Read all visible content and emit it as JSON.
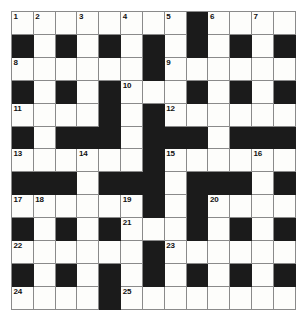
{
  "puzzle": {
    "kind": "crossword-grid",
    "columns": 13,
    "rows": 13,
    "colors": {
      "block": "#1b1b1b",
      "open": "#fdfdfb",
      "gridline": "#8a8a8a",
      "number": "#111111",
      "page_background": "#ffffff"
    },
    "legend": {
      "0": "open cell",
      "1": "blocked cell"
    },
    "grid": [
      [
        0,
        0,
        0,
        0,
        0,
        0,
        0,
        0,
        1,
        0,
        0,
        0,
        0
      ],
      [
        1,
        0,
        1,
        0,
        1,
        0,
        1,
        0,
        1,
        0,
        1,
        0,
        1
      ],
      [
        0,
        0,
        0,
        0,
        0,
        0,
        1,
        0,
        0,
        0,
        0,
        0,
        0
      ],
      [
        1,
        0,
        1,
        0,
        1,
        0,
        0,
        0,
        1,
        0,
        1,
        0,
        1
      ],
      [
        0,
        0,
        0,
        0,
        1,
        0,
        1,
        0,
        0,
        0,
        0,
        0,
        0
      ],
      [
        1,
        0,
        1,
        1,
        1,
        0,
        1,
        1,
        1,
        0,
        1,
        1,
        1
      ],
      [
        0,
        0,
        0,
        0,
        0,
        0,
        1,
        0,
        0,
        0,
        0,
        0,
        0
      ],
      [
        1,
        1,
        1,
        0,
        1,
        1,
        1,
        0,
        1,
        1,
        1,
        0,
        1
      ],
      [
        0,
        0,
        0,
        0,
        0,
        0,
        1,
        0,
        1,
        0,
        0,
        0,
        0
      ],
      [
        1,
        0,
        1,
        0,
        1,
        0,
        0,
        0,
        1,
        0,
        1,
        0,
        1
      ],
      [
        0,
        0,
        0,
        0,
        0,
        0,
        1,
        0,
        0,
        0,
        0,
        0,
        0
      ],
      [
        1,
        0,
        1,
        0,
        1,
        0,
        1,
        0,
        1,
        0,
        1,
        0,
        1
      ],
      [
        0,
        0,
        0,
        0,
        1,
        0,
        0,
        0,
        0,
        0,
        0,
        0,
        0
      ]
    ],
    "numbers": [
      {
        "row": 0,
        "col": 0,
        "label": "1"
      },
      {
        "row": 0,
        "col": 1,
        "label": "2"
      },
      {
        "row": 0,
        "col": 3,
        "label": "3"
      },
      {
        "row": 0,
        "col": 5,
        "label": "4"
      },
      {
        "row": 0,
        "col": 7,
        "label": "5"
      },
      {
        "row": 0,
        "col": 9,
        "label": "6"
      },
      {
        "row": 0,
        "col": 11,
        "label": "7"
      },
      {
        "row": 2,
        "col": 0,
        "label": "8"
      },
      {
        "row": 2,
        "col": 7,
        "label": "9"
      },
      {
        "row": 3,
        "col": 5,
        "label": "10"
      },
      {
        "row": 4,
        "col": 0,
        "label": "11"
      },
      {
        "row": 4,
        "col": 7,
        "label": "12"
      },
      {
        "row": 6,
        "col": 0,
        "label": "13"
      },
      {
        "row": 6,
        "col": 3,
        "label": "14"
      },
      {
        "row": 6,
        "col": 7,
        "label": "15"
      },
      {
        "row": 6,
        "col": 11,
        "label": "16"
      },
      {
        "row": 8,
        "col": 0,
        "label": "17"
      },
      {
        "row": 8,
        "col": 1,
        "label": "18"
      },
      {
        "row": 8,
        "col": 5,
        "label": "19"
      },
      {
        "row": 8,
        "col": 9,
        "label": "20"
      },
      {
        "row": 9,
        "col": 5,
        "label": "21"
      },
      {
        "row": 10,
        "col": 0,
        "label": "22"
      },
      {
        "row": 10,
        "col": 7,
        "label": "23"
      },
      {
        "row": 12,
        "col": 0,
        "label": "24"
      },
      {
        "row": 12,
        "col": 5,
        "label": "25"
      }
    ]
  }
}
